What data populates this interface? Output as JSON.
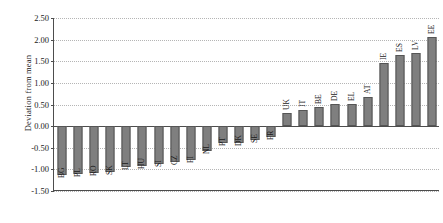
{
  "chart_data": {
    "type": "bar",
    "title": "",
    "xlabel": "",
    "ylabel": "Deviation from mean",
    "ylim": [
      -1.5,
      2.5
    ],
    "ytick_step": 0.5,
    "grid": true,
    "legend": "none",
    "bar_color": "#7f7f7f",
    "bar_edge_color": "#555555",
    "axis_color": "#4d4d4d",
    "grid_color": "#b5b5b5",
    "ytick_labels": [
      "2.50",
      "2.00",
      "1.50",
      "1.00",
      "0.50",
      "0.00",
      "-0.50",
      "-1.00",
      "-1.50"
    ],
    "ytick_values": [
      2.5,
      2.0,
      1.5,
      1.0,
      0.5,
      0.0,
      -0.5,
      -1.0,
      -1.5
    ],
    "categories": [
      "BG",
      "PL",
      "RO",
      "SK",
      "LT",
      "HU",
      "SI",
      "CZ",
      "FI",
      "NL",
      "PT",
      "DK",
      "SE",
      "FR",
      "UK",
      "IT",
      "BE",
      "DE",
      "EL",
      "AT",
      "IE",
      "ES",
      "LV",
      "EE"
    ],
    "values": [
      -1.12,
      -1.1,
      -1.08,
      -1.06,
      -0.95,
      -0.92,
      -0.87,
      -0.84,
      -0.78,
      -0.57,
      -0.4,
      -0.38,
      -0.32,
      -0.25,
      0.3,
      0.38,
      0.44,
      0.52,
      0.52,
      0.68,
      1.45,
      1.65,
      1.7,
      2.05
    ]
  }
}
